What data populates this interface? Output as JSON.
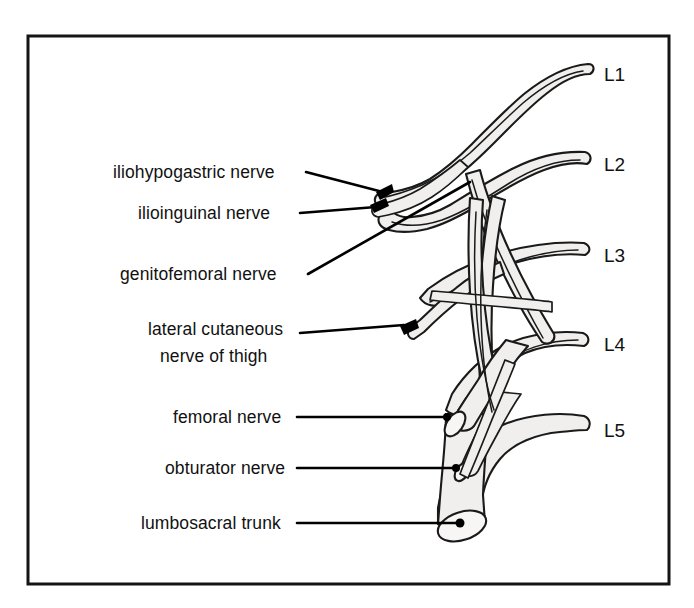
{
  "figure": {
    "type": "anatomical-line-diagram",
    "frame": {
      "visible": true,
      "color": "#141414"
    },
    "colors": {
      "background": "#ffffff",
      "nerve_fill": "#f0efee",
      "outline": "#1a1a1a",
      "leader_line": "#000000",
      "text": "#111111"
    }
  },
  "nerve_labels": [
    {
      "id": "iliohypogastric",
      "label": "iliohypogastric nerve"
    },
    {
      "id": "ilioinguinal",
      "label": "ilioinguinal nerve"
    },
    {
      "id": "genitofemoral",
      "label": "genitofemoral nerve"
    },
    {
      "id": "lateral-cutaneous-1",
      "label": "lateral cutaneous"
    },
    {
      "id": "lateral-cutaneous-2",
      "label": "nerve of thigh"
    },
    {
      "id": "femoral",
      "label": "femoral nerve"
    },
    {
      "id": "obturator",
      "label": "obturator nerve"
    },
    {
      "id": "lumbosacral",
      "label": "lumbosacral trunk"
    }
  ],
  "root_labels": [
    {
      "id": "L1",
      "label": "L1"
    },
    {
      "id": "L2",
      "label": "L2"
    },
    {
      "id": "L3",
      "label": "L3"
    },
    {
      "id": "L4",
      "label": "L4"
    },
    {
      "id": "L5",
      "label": "L5"
    }
  ]
}
